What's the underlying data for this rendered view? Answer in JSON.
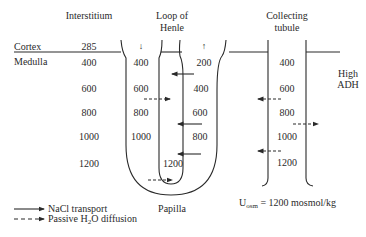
{
  "headers": {
    "interstitium": "Interstitium",
    "loop_line1": "Loop of",
    "loop_line2": "Henle",
    "collecting_line1": "Collecting",
    "collecting_line2": "tubule"
  },
  "regions": {
    "cortex": "Cortex",
    "medulla": "Medulla",
    "papilla": "Papilla"
  },
  "interstitium_values": [
    "285",
    "400",
    "600",
    "800",
    "1000",
    "1200"
  ],
  "descending_limb_values": [
    "400",
    "600",
    "800",
    "1000"
  ],
  "ascending_limb_values": [
    "200",
    "400",
    "600",
    "800"
  ],
  "loop_bottom_value": "1200",
  "collecting_values": [
    "400",
    "600",
    "800",
    "1000",
    "1200"
  ],
  "adh": {
    "line1": "High",
    "line2": "ADH"
  },
  "urine": {
    "prefix": "U",
    "sub": "osm",
    "rest": " = 1200 mosmol/kg"
  },
  "flow_arrows": {
    "descending": "↓",
    "ascending": "↑"
  },
  "legend": {
    "solid": "NaCl transport",
    "dashed_prefix": "Passive H",
    "dashed_sub": "2",
    "dashed_suffix": "O diffusion"
  },
  "colors": {
    "ink": "#2a2a2a",
    "background": "#ffffff"
  }
}
